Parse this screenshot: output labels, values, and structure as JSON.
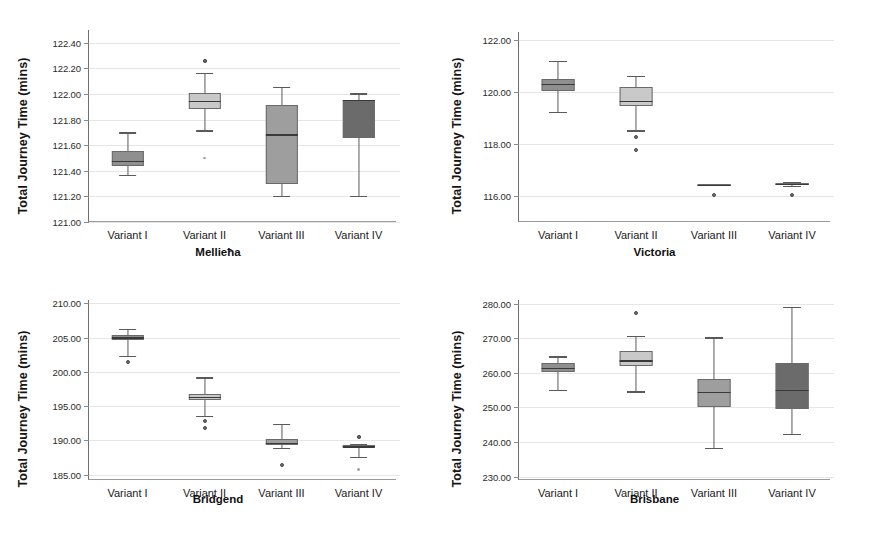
{
  "figure": {
    "width": 873,
    "height": 545,
    "background": "#ffffff",
    "shared_ylabel": "Total Journey Time (mins)",
    "categories": [
      "Variant I",
      "Variant II",
      "Variant III",
      "Variant IV"
    ],
    "box_fill_colors": [
      "#8f8f8f",
      "#c9c9c9",
      "#9e9e9e",
      "#6b6b6b"
    ],
    "line_color": "#5a5a5a",
    "grid_color": "#e6e6e6"
  },
  "chart_data": [
    {
      "type": "box",
      "title": "Mellieħa",
      "xlabel": "Mellieħa",
      "ylabel": "Total Journey Time (mins)",
      "ylim": [
        121.0,
        122.5
      ],
      "yticks": [
        121.0,
        121.2,
        121.4,
        121.6,
        121.8,
        122.0,
        122.2,
        122.4
      ],
      "ytick_labels": [
        "121.00",
        "121.20",
        "121.40",
        "121.60",
        "121.80",
        "122.00",
        "122.20",
        "122.40"
      ],
      "grid": true,
      "categories": [
        "Variant I",
        "Variant II",
        "Variant III",
        "Variant IV"
      ],
      "boxes": [
        {
          "name": "Variant I",
          "whisker_low": 121.37,
          "q1": 121.44,
          "median": 121.48,
          "q3": 121.555,
          "whisker_high": 121.7,
          "outliers": []
        },
        {
          "name": "Variant II",
          "whisker_low": 121.715,
          "q1": 121.885,
          "median": 121.945,
          "q3": 122.01,
          "whisker_high": 122.165,
          "outliers": [
            122.255,
            122.26,
            121.5
          ]
        },
        {
          "name": "Variant III",
          "whisker_low": 121.205,
          "q1": 121.295,
          "median": 121.685,
          "q3": 121.915,
          "whisker_high": 122.055,
          "outliers": []
        },
        {
          "name": "Variant IV",
          "whisker_low": 121.205,
          "q1": 121.66,
          "median": 121.955,
          "q3": 121.955,
          "whisker_high": 122.005,
          "outliers": []
        }
      ]
    },
    {
      "type": "box",
      "title": "Victoria",
      "xlabel": "Victoria",
      "ylabel": "Total Journey Time (mins)",
      "ylim": [
        115.0,
        122.3
      ],
      "yticks": [
        116.0,
        118.0,
        120.0,
        122.0
      ],
      "ytick_labels": [
        "116.00",
        "118.00",
        "120.00",
        "122.00"
      ],
      "grid": true,
      "categories": [
        "Variant I",
        "Variant II",
        "Variant III",
        "Variant IV"
      ],
      "boxes": [
        {
          "name": "Variant I",
          "whisker_low": 119.22,
          "q1": 120.05,
          "median": 120.32,
          "q3": 120.48,
          "whisker_high": 121.19,
          "outliers": []
        },
        {
          "name": "Variant II",
          "whisker_low": 118.52,
          "q1": 119.45,
          "median": 119.66,
          "q3": 120.18,
          "whisker_high": 120.6,
          "outliers": [
            118.26,
            117.77
          ]
        },
        {
          "name": "Variant III",
          "whisker_low": 116.42,
          "q1": 116.42,
          "median": 116.42,
          "q3": 116.45,
          "whisker_high": 116.45,
          "outliers": [
            116.02
          ]
        },
        {
          "name": "Variant IV",
          "whisker_low": 116.4,
          "q1": 116.43,
          "median": 116.46,
          "q3": 116.49,
          "whisker_high": 116.52,
          "outliers": [
            116.03
          ]
        }
      ]
    },
    {
      "type": "box",
      "title": "Bridgend",
      "xlabel": "Bridgend",
      "ylabel": "Total Journey Time (mins)",
      "ylim": [
        184.2,
        210.5
      ],
      "yticks": [
        185.0,
        190.0,
        195.0,
        200.0,
        205.0,
        210.0
      ],
      "ytick_labels": [
        "185.00",
        "190.00",
        "195.00",
        "200.00",
        "205.00",
        "210.00"
      ],
      "grid": true,
      "categories": [
        "Variant I",
        "Variant II",
        "Variant III",
        "Variant IV"
      ],
      "boxes": [
        {
          "name": "Variant I",
          "whisker_low": 202.3,
          "q1": 204.6,
          "median": 205.05,
          "q3": 205.45,
          "whisker_high": 206.25,
          "outliers": [
            201.45
          ]
        },
        {
          "name": "Variant II",
          "whisker_low": 193.55,
          "q1": 195.85,
          "median": 196.35,
          "q3": 196.75,
          "whisker_high": 199.2,
          "outliers": [
            192.85,
            191.75
          ]
        },
        {
          "name": "Variant III",
          "whisker_low": 188.85,
          "q1": 189.25,
          "median": 189.65,
          "q3": 190.25,
          "whisker_high": 192.45,
          "outliers": [
            186.45
          ]
        },
        {
          "name": "Variant IV",
          "whisker_low": 187.55,
          "q1": 189.0,
          "median": 189.15,
          "q3": 189.3,
          "whisker_high": 189.5,
          "outliers": [
            190.55,
            190.45,
            185.75
          ]
        }
      ]
    },
    {
      "type": "box",
      "title": "Brisbane",
      "xlabel": "Brisbane",
      "ylabel": "Total Journey Time (mins)",
      "ylim": [
        229.0,
        281.0
      ],
      "yticks": [
        230.0,
        240.0,
        250.0,
        260.0,
        270.0,
        280.0
      ],
      "ytick_labels": [
        "230.00",
        "240.00",
        "250.00",
        "260.00",
        "270.00",
        "280.00"
      ],
      "grid": true,
      "categories": [
        "Variant I",
        "Variant II",
        "Variant III",
        "Variant IV"
      ],
      "boxes": [
        {
          "name": "Variant I",
          "whisker_low": 255.0,
          "q1": 260.3,
          "median": 261.4,
          "q3": 262.7,
          "whisker_high": 264.7,
          "outliers": []
        },
        {
          "name": "Variant II",
          "whisker_low": 254.6,
          "q1": 261.8,
          "median": 263.6,
          "q3": 266.4,
          "whisker_high": 270.6,
          "outliers": [
            277.3
          ]
        },
        {
          "name": "Variant III",
          "whisker_low": 238.3,
          "q1": 250.0,
          "median": 254.4,
          "q3": 258.3,
          "whisker_high": 270.2,
          "outliers": []
        },
        {
          "name": "Variant IV",
          "whisker_low": 242.2,
          "q1": 249.4,
          "median": 255.0,
          "q3": 262.7,
          "whisker_high": 279.0,
          "outliers": []
        }
      ]
    }
  ]
}
